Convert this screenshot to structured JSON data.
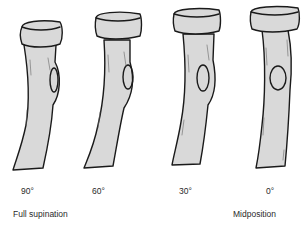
{
  "figure": {
    "colors": {
      "bone_fill": "#d9d9d9",
      "outline": "#1a1a1a",
      "background": "#ffffff"
    },
    "bones": [
      {
        "angle_label": "90°",
        "position_label": "Full supination"
      },
      {
        "angle_label": "60°",
        "position_label": ""
      },
      {
        "angle_label": "30°",
        "position_label": ""
      },
      {
        "angle_label": "0°",
        "position_label": "Midposition"
      }
    ]
  }
}
